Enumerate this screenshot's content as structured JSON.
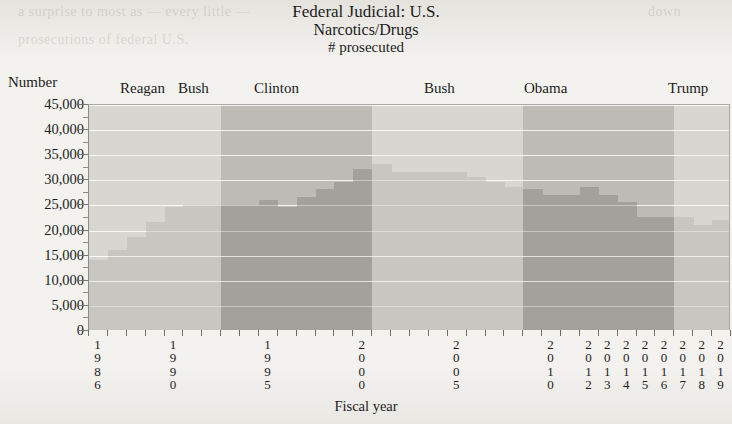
{
  "title": {
    "line1": "Federal Judicial: U.S.",
    "line2": "Narcotics/Drugs",
    "line3": "# prosecuted"
  },
  "axis": {
    "y_label": "Number",
    "x_label": "Fiscal year",
    "y_ticks": [
      "45,000",
      "40,000",
      "35,000",
      "30,000",
      "25,000",
      "20,000",
      "15,000",
      "10,000",
      "5,000",
      "0"
    ]
  },
  "presidents": [
    {
      "name": "Reagan",
      "x": 120
    },
    {
      "name": "Bush",
      "x": 178
    },
    {
      "name": "Clinton",
      "x": 254
    },
    {
      "name": "Bush",
      "x": 424
    },
    {
      "name": "Obama",
      "x": 524
    },
    {
      "name": "Trump",
      "x": 668
    }
  ],
  "colors": {
    "band_light": "#d8d6d1",
    "band_dark": "#bdbbb6",
    "bar_light": "#c8c6c1",
    "bar_dark": "#a3a19c",
    "gridline": "#ffffff",
    "axis": "#77766f",
    "text": "#1c1c1c",
    "page": "#f2f1ee"
  },
  "chart_data": {
    "type": "bar",
    "title": "Federal Judicial: U.S. Narcotics/Drugs # prosecuted",
    "xlabel": "Fiscal year",
    "ylabel": "Number",
    "ylim": [
      0,
      45000
    ],
    "ytick_step": 5000,
    "grid": true,
    "legend": "none",
    "bar_count": 34,
    "categories": [
      "1986",
      "1987",
      "1988",
      "1989",
      "1990",
      "1991",
      "1992",
      "1993",
      "1994",
      "1995",
      "1996",
      "1997",
      "1998",
      "1999",
      "2000",
      "2001",
      "2002",
      "2003",
      "2004",
      "2005",
      "2006",
      "2007",
      "2008",
      "2009",
      "2010",
      "2011",
      "2012",
      "2013",
      "2014",
      "2015",
      "2016",
      "2017",
      "2018",
      "2019"
    ],
    "tick_labels_shown": [
      "1986",
      "1990",
      "1995",
      "2000",
      "2005",
      "2010",
      "2012",
      "2013",
      "2014",
      "2015",
      "2016",
      "2017",
      "2018",
      "2019"
    ],
    "values": [
      14000,
      16000,
      18500,
      21500,
      24500,
      24800,
      24800,
      24800,
      24800,
      25800,
      24500,
      26500,
      28000,
      29500,
      32000,
      33000,
      31500,
      31500,
      31500,
      31500,
      30500,
      29500,
      28500,
      28000,
      26800,
      26800,
      28500,
      26800,
      25500,
      22500,
      22500,
      22500,
      21000,
      22000
    ],
    "administrations": [
      {
        "name": "Reagan",
        "shade": "light",
        "start_year": 1986,
        "end_year": 1988
      },
      {
        "name": "Bush",
        "shade": "light",
        "start_year": 1989,
        "end_year": 1992
      },
      {
        "name": "Clinton",
        "shade": "dark",
        "start_year": 1993,
        "end_year": 2000
      },
      {
        "name": "Bush",
        "shade": "light",
        "start_year": 2001,
        "end_year": 2008
      },
      {
        "name": "Obama",
        "shade": "dark",
        "start_year": 2009,
        "end_year": 2016
      },
      {
        "name": "Trump",
        "shade": "light",
        "start_year": 2017,
        "end_year": 2019
      }
    ],
    "annotations": [
      {
        "text": "peak",
        "year": 2001,
        "value": 33000
      }
    ]
  },
  "ghosts": {
    "g1": "a surprise to most as — every little —",
    "g2": "prosecutions of federal U.S.",
    "g3": "down"
  }
}
